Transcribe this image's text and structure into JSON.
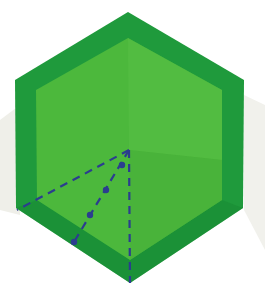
{
  "figure": {
    "colors": {
      "background": "#ffffff",
      "shadow": "#ecece6",
      "outer_border": "#1f9a3c",
      "outer_border_dark": "#178a33",
      "inner_face": "#4cb83c",
      "inner_face_light": "#5cc248",
      "fold_line": "#2b3d8f"
    },
    "outer_hexagon": [
      [
        128,
        12
      ],
      [
        244,
        80
      ],
      [
        243,
        208
      ],
      [
        130,
        283
      ],
      [
        16,
        208
      ],
      [
        15,
        80
      ]
    ],
    "inner_hexagon": [
      [
        128,
        38
      ],
      [
        222,
        90
      ],
      [
        222,
        200
      ],
      [
        130,
        260
      ],
      [
        37,
        200
      ],
      [
        36,
        90
      ]
    ],
    "fold_apex": [
      129,
      150
    ],
    "fold_lines": {
      "left_dashed_end": [
        17,
        210
      ],
      "vertical_dashed_end": [
        130,
        283
      ],
      "dotted_dashed_end": [
        74,
        242
      ],
      "dots": [
        [
          122,
          165
        ],
        [
          106,
          190
        ],
        [
          90,
          215
        ],
        [
          74,
          242
        ]
      ]
    }
  }
}
